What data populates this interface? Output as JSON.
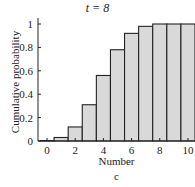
{
  "chart_data": {
    "type": "bar",
    "title": "t = 8",
    "xlabel": "Number",
    "ylabel": "Cumulative probability",
    "caption": "c",
    "categories": [
      0,
      1,
      2,
      3,
      4,
      5,
      6,
      7,
      8,
      9,
      10
    ],
    "values": [
      0.004,
      0.03,
      0.12,
      0.31,
      0.56,
      0.78,
      0.92,
      0.98,
      1.0,
      1.0,
      1.0
    ],
    "ylim": [
      0,
      1
    ],
    "yticks": [
      0,
      0.2,
      0.4,
      0.6,
      0.8,
      1
    ],
    "ytick_labels": [
      "0",
      "0.2",
      "0.4",
      "0.6",
      "0.8",
      "1"
    ],
    "xticks": [
      0,
      2,
      4,
      6,
      8,
      10
    ],
    "xtick_labels": [
      "0",
      "2",
      "4",
      "6",
      "8",
      "10"
    ],
    "grid": false,
    "bar_color": "#d9d9d9",
    "edge_color": "#222222"
  }
}
